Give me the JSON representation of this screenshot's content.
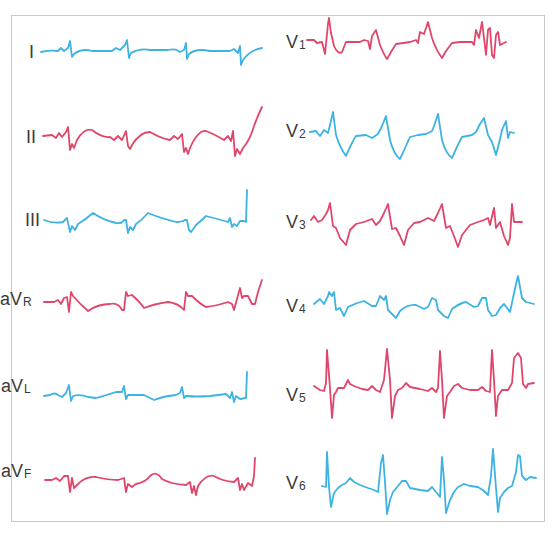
{
  "figure": {
    "type": "12-lead ECG",
    "colors": {
      "red": "#e0456a",
      "blue": "#3db3e3",
      "label": "#3a3a3a",
      "frame": "#c9c9c9"
    },
    "limb_leads": [
      {
        "id": "I",
        "main": "I",
        "sub": "",
        "color": "blue"
      },
      {
        "id": "II",
        "main": "II",
        "sub": "",
        "color": "red"
      },
      {
        "id": "III",
        "main": "III",
        "sub": "",
        "color": "blue"
      },
      {
        "id": "aVR",
        "main": "aV",
        "sub": "R",
        "color": "red"
      },
      {
        "id": "aVL",
        "main": "aV",
        "sub": "L",
        "color": "blue"
      },
      {
        "id": "aVF",
        "main": "aV",
        "sub": "F",
        "color": "red"
      }
    ],
    "chest_leads": [
      {
        "id": "V1",
        "main": "V",
        "sub": "1",
        "color": "red"
      },
      {
        "id": "V2",
        "main": "V",
        "sub": "2",
        "color": "blue"
      },
      {
        "id": "V3",
        "main": "V",
        "sub": "3",
        "color": "red"
      },
      {
        "id": "V4",
        "main": "V",
        "sub": "4",
        "color": "blue"
      },
      {
        "id": "V5",
        "main": "V",
        "sub": "5",
        "color": "red"
      },
      {
        "id": "V6",
        "main": "V",
        "sub": "6",
        "color": "blue"
      }
    ]
  }
}
